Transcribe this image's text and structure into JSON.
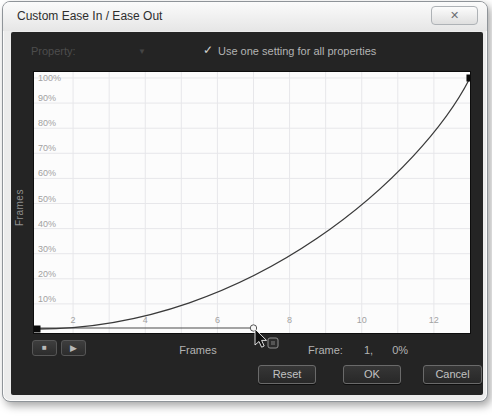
{
  "window": {
    "title": "Custom Ease In / Ease Out",
    "close_glyph": "✕"
  },
  "property_row": {
    "label": "Property:",
    "dropdown_glyph": "▼",
    "checkbox_glyph": "✓",
    "checkbox_checked": true,
    "checkbox_label": "Use one setting for all properties"
  },
  "chart_data": {
    "type": "line",
    "title": "",
    "xlabel": "Frames",
    "ylabel": "Frames",
    "xlim": [
      1,
      13
    ],
    "ylim": [
      0,
      100
    ],
    "grid": true,
    "x_ticks": [
      2,
      4,
      6,
      8,
      10,
      12
    ],
    "x_grid_frames": [
      2,
      3,
      4,
      5,
      6,
      7,
      8,
      9,
      10,
      11,
      12
    ],
    "y_ticks": [
      {
        "percent": 100,
        "label": "100%"
      },
      {
        "percent": 90,
        "label": "90%"
      },
      {
        "percent": 80,
        "label": "80%"
      },
      {
        "percent": 70,
        "label": "70%"
      },
      {
        "percent": 60,
        "label": "60%"
      },
      {
        "percent": 50,
        "label": "50%"
      },
      {
        "percent": 40,
        "label": "40%"
      },
      {
        "percent": 30,
        "label": "30%"
      },
      {
        "percent": 20,
        "label": "20%"
      },
      {
        "percent": 10,
        "label": "10%"
      }
    ],
    "keyframes": [
      {
        "frame": 1,
        "percent": 0
      },
      {
        "frame": 13,
        "percent": 100
      }
    ],
    "bezier": {
      "p0": {
        "frame": 1,
        "percent": 0
      },
      "c1": {
        "frame": 7,
        "percent": 0
      },
      "c2": {
        "frame": 11.7,
        "percent": 63
      },
      "p3": {
        "frame": 13,
        "percent": 100
      }
    },
    "handle": {
      "from": {
        "frame": 1,
        "percent": 0
      },
      "to": {
        "frame": 7,
        "percent": 0
      }
    }
  },
  "transport": {
    "stop_glyph": "■",
    "play_glyph": "▶"
  },
  "status": {
    "x_axis_label": "Frames",
    "frame_label": "Frame:",
    "frame_value": "1,",
    "percent_value": "0%"
  },
  "buttons": {
    "reset": "Reset",
    "ok": "OK",
    "cancel": "Cancel"
  },
  "colors": {
    "panel_bg": "#242424",
    "graph_bg": "#fcfcfc",
    "grid": "#e7e7ea",
    "curve": "#3a3a3a",
    "tick_text": "#a2a2a2",
    "keyframe": "#0a0a0a",
    "label_text": "#b3b3b3"
  }
}
